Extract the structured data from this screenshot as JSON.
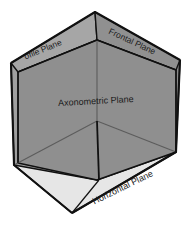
{
  "figure": {
    "background_color": "#ffffff",
    "width": 192,
    "height": 227
  },
  "colors": {
    "axonometric_face": "#8f8f8f",
    "profile_face": "#a3a3a3",
    "frontal_face": "#8a8a8a",
    "horizontal_face": "#e6e6e6",
    "outline": "#111111",
    "inner_line": "#5f5f5f",
    "label_text": "#1c1c1c"
  },
  "labels": {
    "profile": "ofile Plane",
    "frontal": "Frontal Plane",
    "axonometric": "Axonometric Plane",
    "horizontal": "Horizontal Plane"
  },
  "label_meta": [
    {
      "name": "profile-plane-label",
      "text": "ofile Plane",
      "x": 44,
      "y": 52,
      "rotation": -22,
      "font_size": 8.5,
      "clipped": true
    },
    {
      "name": "frontal-plane-label",
      "text": "Frontal Plane",
      "x": 131,
      "y": 44,
      "rotation": 25,
      "font_size": 8.5,
      "clipped": false
    },
    {
      "name": "axonometric-plane-label",
      "text": "Axonometric Plane",
      "x": 96,
      "y": 104,
      "rotation": -3,
      "font_size": 9,
      "clipped": false
    },
    {
      "name": "horizontal-plane-label",
      "text": "Horizontal Plane",
      "x": 124,
      "y": 190,
      "rotation": -26,
      "font_size": 9,
      "clipped": false
    }
  ],
  "geometry": {
    "top_apex": [
      95,
      12
    ],
    "left_vertex": [
      11,
      63
    ],
    "right_vertex": [
      180,
      60
    ],
    "bottom_vertex": [
      72,
      213
    ],
    "center_vertex": [
      97,
      121
    ],
    "lower_left": [
      14,
      165
    ],
    "lower_right": [
      176,
      152
    ],
    "inner_front": [
      99,
      177
    ]
  }
}
